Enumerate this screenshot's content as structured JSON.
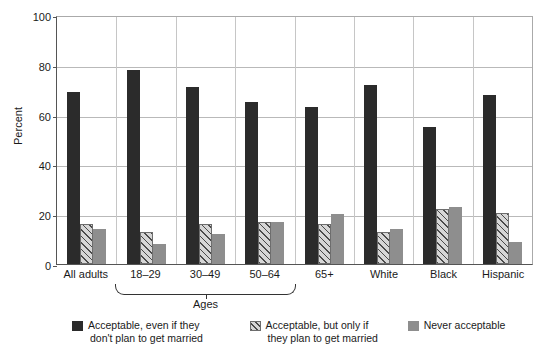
{
  "chart_data": {
    "type": "bar",
    "title": "",
    "xlabel": "",
    "ylabel": "Percent",
    "ylim": [
      0,
      100
    ],
    "yticks": [
      0,
      20,
      40,
      60,
      80,
      100
    ],
    "grid": true,
    "legend_position": "bottom",
    "categories": [
      "All adults",
      "18–29",
      "30–49",
      "50–64",
      "65+",
      "White",
      "Black",
      "Hispanic"
    ],
    "group_bracket": {
      "label": "Ages",
      "spans": [
        "18–29",
        "30–49",
        "50–64",
        "65+"
      ]
    },
    "series": [
      {
        "name": "Acceptable, even if they don't plan to get married",
        "pattern": "solid-dark",
        "color": "#2b2b2b",
        "values": [
          69,
          78,
          71,
          65,
          63,
          72,
          55,
          68
        ]
      },
      {
        "name": "Acceptable, but only if they plan to get married",
        "pattern": "diagonal-hatch",
        "color": "#d6d6d6",
        "values": [
          16,
          13,
          16,
          17,
          16,
          13,
          22,
          20.5
        ]
      },
      {
        "name": "Never acceptable",
        "pattern": "solid-gray",
        "color": "#8e8e8e",
        "values": [
          14,
          8,
          12,
          17,
          20,
          14,
          23,
          9
        ]
      }
    ]
  },
  "legend": [
    {
      "line1": "Acceptable, even if they",
      "line2": "don't plan to get married"
    },
    {
      "line1": "Acceptable, but only if",
      "line2": "they plan to get married"
    },
    {
      "line1": "Never acceptable",
      "line2": ""
    }
  ]
}
